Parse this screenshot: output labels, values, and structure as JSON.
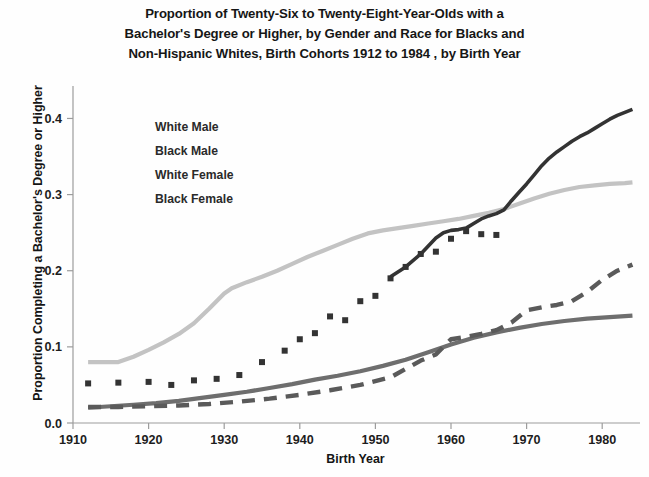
{
  "chart_data": {
    "type": "line",
    "title": "Proportion of Twenty-Six to Twenty-Eight-Year-Olds with a Bachelor's Degree or Higher, by Gender and Race for Blacks and Non-Hispanic Whites, Birth Cohorts 1912 to 1984 , by Birth Year",
    "title_lines": [
      "Proportion of Twenty-Six to Twenty-Eight-Year-Olds with a",
      "Bachelor's Degree or Higher, by Gender and Race for Blacks and",
      "Non-Hispanic Whites, Birth Cohorts 1912 to 1984 , by Birth Year"
    ],
    "xlabel": "Birth Year",
    "ylabel": "Proportion Completing a Bachelor's Degree or Higher",
    "xlim": [
      1910,
      1985
    ],
    "ylim": [
      0.0,
      0.44
    ],
    "xticks": [
      1910,
      1920,
      1930,
      1940,
      1950,
      1960,
      1970,
      1980
    ],
    "xticklabels": [
      "1910",
      "1920",
      "1930",
      "1940",
      "1950",
      "1960",
      "1970",
      "1980"
    ],
    "yticks": [
      0.0,
      0.1,
      0.2,
      0.3,
      0.4
    ],
    "yticklabels": [
      "0.0",
      "0.1",
      "0.2",
      "0.3",
      "0.4"
    ],
    "grid": false,
    "legend_position": "upper-left-inside",
    "legend_entries": [
      "White Male",
      "Black Male",
      "White Female",
      "Black Female"
    ],
    "series": [
      {
        "name": "White Male",
        "color": "#c3c3c3",
        "style": "solid",
        "width": 4.2,
        "x": [
          1912,
          1914,
          1916,
          1918,
          1920,
          1922,
          1924,
          1926,
          1928,
          1930,
          1931,
          1933,
          1935,
          1937,
          1939,
          1941,
          1943,
          1945,
          1947,
          1949,
          1951,
          1953,
          1955,
          1957,
          1959,
          1961,
          1963,
          1965,
          1967,
          1969,
          1971,
          1973,
          1975,
          1977,
          1979,
          1981,
          1983,
          1984
        ],
        "values": [
          0.08,
          0.08,
          0.08,
          0.087,
          0.096,
          0.106,
          0.117,
          0.131,
          0.15,
          0.17,
          0.177,
          0.185,
          0.192,
          0.2,
          0.209,
          0.218,
          0.226,
          0.234,
          0.242,
          0.249,
          0.253,
          0.256,
          0.259,
          0.262,
          0.265,
          0.268,
          0.272,
          0.276,
          0.281,
          0.288,
          0.295,
          0.301,
          0.306,
          0.31,
          0.312,
          0.314,
          0.315,
          0.316
        ]
      },
      {
        "name": "Black Male",
        "color": "#6e6e6e",
        "style": "solid",
        "width": 4.2,
        "x": [
          1912,
          1915,
          1918,
          1921,
          1924,
          1927,
          1930,
          1933,
          1936,
          1939,
          1942,
          1945,
          1948,
          1951,
          1954,
          1957,
          1960,
          1963,
          1966,
          1969,
          1972,
          1975,
          1978,
          1981,
          1984
        ],
        "values": [
          0.02,
          0.022,
          0.024,
          0.026,
          0.029,
          0.033,
          0.037,
          0.041,
          0.046,
          0.051,
          0.057,
          0.062,
          0.068,
          0.075,
          0.083,
          0.093,
          0.103,
          0.112,
          0.119,
          0.125,
          0.13,
          0.134,
          0.137,
          0.139,
          0.141
        ]
      },
      {
        "name": "White Female",
        "color": "#333333",
        "style": "solid",
        "width": 3.6,
        "x": [
          1952,
          1954,
          1956,
          1958,
          1959,
          1960,
          1961,
          1962,
          1963,
          1964,
          1965,
          1966,
          1967,
          1968,
          1969,
          1970,
          1971,
          1972,
          1973,
          1974,
          1975,
          1976,
          1977,
          1978,
          1979,
          1980,
          1981,
          1982,
          1983,
          1984
        ],
        "values": [
          0.192,
          0.205,
          0.222,
          0.243,
          0.25,
          0.253,
          0.254,
          0.256,
          0.262,
          0.268,
          0.272,
          0.275,
          0.28,
          0.292,
          0.303,
          0.314,
          0.326,
          0.338,
          0.348,
          0.356,
          0.363,
          0.37,
          0.376,
          0.381,
          0.387,
          0.393,
          0.399,
          0.404,
          0.408,
          0.412
        ],
        "markers_x": [
          1912,
          1916,
          1920,
          1923,
          1926,
          1929,
          1932,
          1935,
          1938,
          1940,
          1942,
          1944,
          1946,
          1948,
          1950,
          1952,
          1954,
          1956,
          1958,
          1960,
          1962,
          1964,
          1966
        ],
        "markers_y": [
          0.052,
          0.053,
          0.054,
          0.05,
          0.056,
          0.058,
          0.063,
          0.08,
          0.095,
          0.11,
          0.118,
          0.14,
          0.135,
          0.16,
          0.167,
          0.19,
          0.205,
          0.222,
          0.225,
          0.242,
          0.252,
          0.248,
          0.247
        ]
      },
      {
        "name": "Black Female",
        "color": "#5a5a5a",
        "style": "dashed",
        "width": 4.4,
        "x": [
          1912,
          1916,
          1920,
          1924,
          1928,
          1932,
          1936,
          1940,
          1944,
          1948,
          1952,
          1956,
          1958,
          1960,
          1962,
          1964,
          1966,
          1968,
          1970,
          1972,
          1974,
          1976,
          1978,
          1980,
          1982,
          1984
        ],
        "values": [
          0.021,
          0.021,
          0.022,
          0.023,
          0.025,
          0.028,
          0.032,
          0.037,
          0.043,
          0.05,
          0.06,
          0.082,
          0.09,
          0.11,
          0.113,
          0.117,
          0.122,
          0.132,
          0.148,
          0.152,
          0.155,
          0.16,
          0.172,
          0.188,
          0.2,
          0.208
        ]
      }
    ]
  }
}
